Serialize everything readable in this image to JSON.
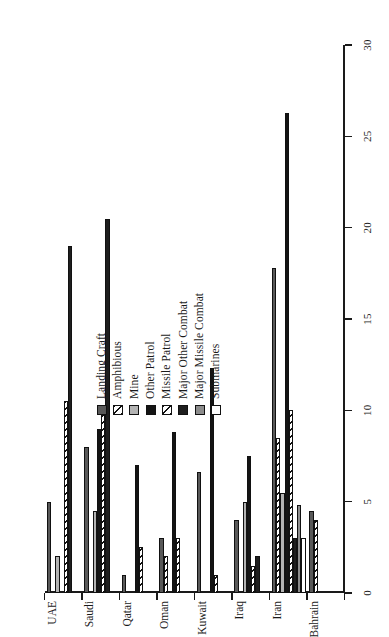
{
  "chart_data": {
    "type": "bar",
    "orientation": "horizontal",
    "title": "",
    "subtitle": "",
    "xlabel": "",
    "ylabel": "",
    "xlim": [
      0,
      30
    ],
    "ylim": null,
    "grid": false,
    "legend_position": "inside-upper-right",
    "tick_labels": [
      "0",
      "5",
      "10",
      "15",
      "20",
      "25",
      "30"
    ],
    "tick_values": [
      0,
      5,
      10,
      15,
      20,
      25,
      30
    ],
    "categories": [
      "Bahrain",
      "Iran",
      "Iraq",
      "Kuwait",
      "Oman",
      "Qatar",
      "Saudi",
      "UAE"
    ],
    "series": [
      {
        "name": "Landing Craft",
        "swatch": "sw-landing",
        "color": "#595959",
        "values": [
          4.5,
          17.8,
          4.0,
          6.6,
          3.0,
          1.0,
          8.0,
          5.0
        ]
      },
      {
        "name": "Amphibious",
        "swatch": "sw-amphibious",
        "color": "#ffffff",
        "values": [
          4.0,
          8.5,
          0.0,
          0.0,
          2.0,
          0.0,
          0.0,
          0.0
        ]
      },
      {
        "name": "Mine",
        "swatch": "sw-mine",
        "color": "#b3b3b3",
        "values": [
          0.0,
          5.5,
          5.0,
          0.0,
          0.0,
          0.0,
          4.5,
          2.0
        ]
      },
      {
        "name": "Other Patrol",
        "swatch": "sw-other-patrol",
        "color": "#141414",
        "values": [
          0.0,
          26.3,
          7.5,
          12.3,
          8.8,
          7.0,
          9.0,
          0.0
        ]
      },
      {
        "name": "Missile Patrol",
        "swatch": "sw-missile-patrol",
        "color": "#ffffff",
        "values": [
          0.0,
          10.0,
          1.5,
          1.0,
          3.0,
          2.5,
          10.0,
          10.5
        ]
      },
      {
        "name": "Major Other Combat",
        "swatch": "sw-major-other",
        "color": "#1e1e1e",
        "values": [
          0.0,
          3.0,
          2.0,
          0.0,
          0.0,
          0.0,
          20.5,
          19.0
        ]
      },
      {
        "name": "Major Missile Combat",
        "swatch": "sw-major-missile",
        "color": "#8c8c8c",
        "values": [
          0.0,
          4.8,
          0.0,
          0.0,
          0.0,
          0.0,
          0.0,
          0.0
        ]
      },
      {
        "name": "Submarines",
        "swatch": "sw-submarines",
        "color": "#ffffff",
        "values": [
          0.0,
          3.0,
          0.0,
          0.0,
          0.0,
          0.0,
          0.0,
          0.0
        ]
      }
    ]
  }
}
